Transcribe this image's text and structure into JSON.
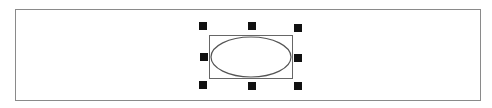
{
  "canvas": {
    "background": "#ffffff",
    "frame_border_color": "#8a8a8a"
  },
  "selection": {
    "shape": "ellipse",
    "bbox_color": "#666666",
    "handle_color": "#111111",
    "handles": [
      "top-left",
      "top-center",
      "top-right",
      "middle-left",
      "middle-right",
      "bottom-left",
      "bottom-center",
      "bottom-right"
    ]
  }
}
